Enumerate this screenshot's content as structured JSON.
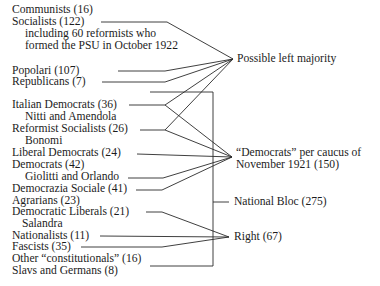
{
  "parties": [
    {
      "label": "Communists (16)"
    },
    {
      "label": "Socialists (122)"
    },
    {
      "label": "including 60 reformists who"
    },
    {
      "label": "formed the PSU in October 1922"
    },
    {
      "label": "Popolari (107)"
    },
    {
      "label": "Republicans (7)"
    },
    {
      "label": "Italian Democrats (36)"
    },
    {
      "label": "Nitti and Amendola"
    },
    {
      "label": "Reformist Socialists (26)"
    },
    {
      "label": "Bonomi"
    },
    {
      "label": "Liberal Democrats (24)"
    },
    {
      "label": "Democrats (42)"
    },
    {
      "label": "Giolitti and Orlando"
    },
    {
      "label": "Democrazia Sociale (41)"
    },
    {
      "label": "Agrarians (23)"
    },
    {
      "label": "Democratic Liberals (21)"
    },
    {
      "label": "Salandra"
    },
    {
      "label": "Nationalists (11)"
    },
    {
      "label": "Fascists (35)"
    },
    {
      "label": "Other “constitutionals” (16)"
    },
    {
      "label": "Slavs and Germans (8)"
    }
  ],
  "groups": {
    "left_majority": "Possible left majority",
    "democrats_line1": "“Democrats” per caucus of",
    "democrats_line2": "November 1921 (150)",
    "national_bloc": "National Bloc (275)",
    "right": "Right (67)"
  },
  "line_color": "#2a2a2a"
}
